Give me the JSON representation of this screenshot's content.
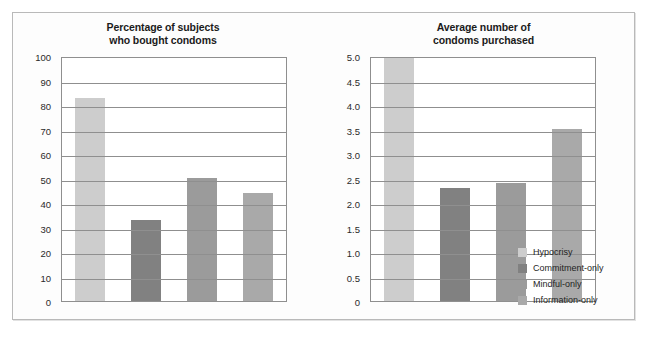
{
  "chart_data": [
    {
      "type": "bar",
      "title": "Percentage of subjects\nwho bought condoms",
      "title_line1": "Percentage of subjects",
      "title_line2": "who bought condoms",
      "categories": [
        "Hypocrisy",
        "Commitment-only",
        "Mindful-only",
        "Information-only"
      ],
      "values": [
        83,
        33,
        50,
        44
      ],
      "xlabel": "",
      "ylabel": "",
      "ylim": [
        0,
        100
      ],
      "yticks": [
        100,
        90,
        80,
        70,
        60,
        50,
        40,
        30,
        20,
        10,
        0
      ],
      "ytick_labels": [
        "100",
        "90",
        "80",
        "70",
        "60",
        "50",
        "40",
        "30",
        "20",
        "10",
        "0"
      ],
      "grid": true,
      "legend_position": "outside-bottom-right"
    },
    {
      "type": "bar",
      "title": "Average number of\ncondoms purchased",
      "title_line1": "Average number of",
      "title_line2": "condoms purchased",
      "categories": [
        "Hypocrisy",
        "Commitment-only",
        "Mindful-only",
        "Information-only"
      ],
      "values": [
        4.95,
        2.3,
        2.4,
        3.5
      ],
      "xlabel": "",
      "ylabel": "",
      "ylim": [
        0,
        5.0
      ],
      "yticks": [
        5.0,
        4.5,
        4.0,
        3.5,
        3.0,
        2.5,
        2.0,
        1.5,
        1.0,
        0.5,
        0
      ],
      "ytick_labels": [
        "5.0",
        "4.5",
        "4.0",
        "3.5",
        "3.0",
        "2.5",
        "2.0",
        "1.5",
        "1.0",
        "0.5",
        "0"
      ],
      "grid": true,
      "legend_position": "outside-bottom-right"
    }
  ],
  "legend": {
    "items": [
      {
        "label": "Hypocrisy",
        "color": "#cdcdcd"
      },
      {
        "label": "Commitment-only",
        "color": "#818181"
      },
      {
        "label": "Mindful-only",
        "color": "#9b9b9b"
      },
      {
        "label": "Information-only",
        "color": "#a9a9a9"
      }
    ]
  },
  "colors": {
    "hypocrisy": "#cdcdcd",
    "commitment_only": "#818181",
    "mindful_only": "#9b9b9b",
    "information_only": "#a9a9a9",
    "axis": "#8f8f8f",
    "frame": "#b9b9b9",
    "text": "#1b1b1b"
  }
}
